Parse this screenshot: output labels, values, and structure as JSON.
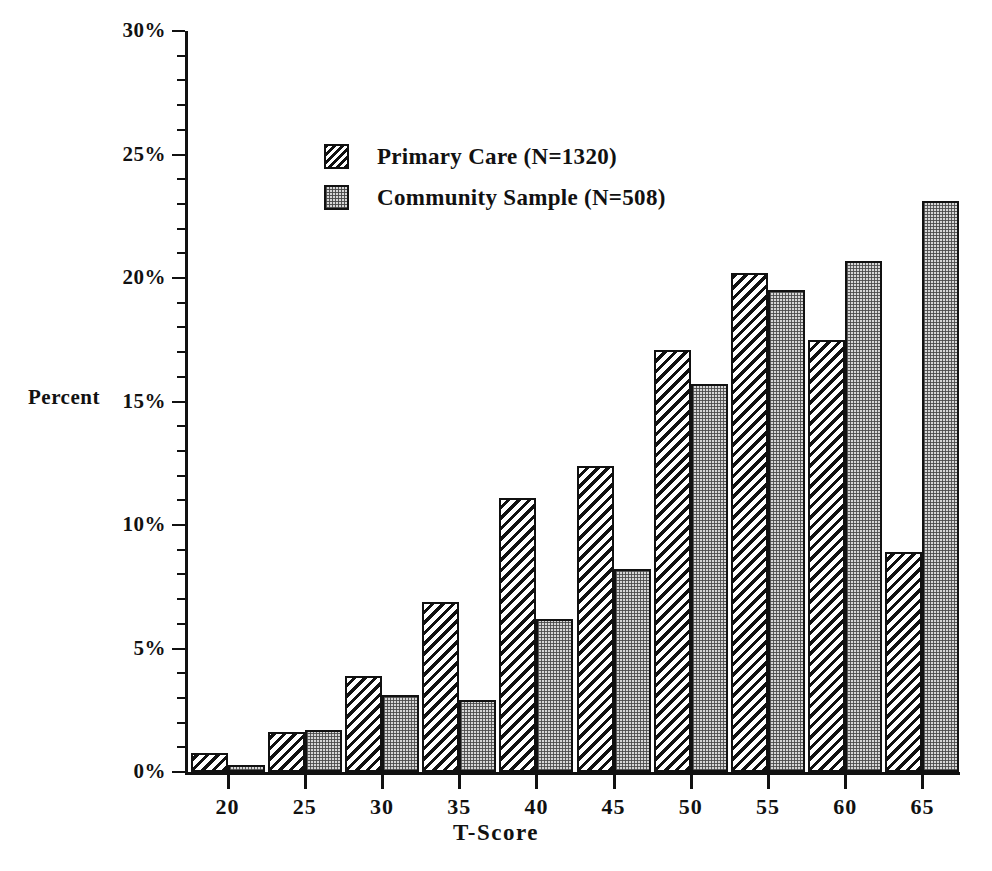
{
  "chart_data": {
    "type": "bar",
    "title": "",
    "xlabel": "T-Score",
    "ylabel": "Percent",
    "categories": [
      "20",
      "25",
      "30",
      "35",
      "40",
      "45",
      "50",
      "55",
      "60",
      "65"
    ],
    "series": [
      {
        "name": "Primary Care (N=1320)",
        "pattern": "diagonal-hatch",
        "values": [
          0.75,
          1.6,
          3.9,
          6.9,
          11.1,
          12.4,
          17.1,
          20.2,
          17.5,
          8.9
        ]
      },
      {
        "name": "Community Sample (N=508)",
        "pattern": "dotted-stipple",
        "values": [
          0.3,
          1.7,
          3.1,
          2.9,
          6.2,
          8.2,
          15.7,
          19.5,
          20.7,
          23.1
        ]
      }
    ],
    "ylim": [
      0,
      30
    ],
    "ytick_labels": [
      "0%",
      "5%",
      "10%",
      "15%",
      "20%",
      "25%",
      "30%"
    ],
    "ytick_values": [
      0,
      5,
      10,
      15,
      20,
      25,
      30
    ],
    "yminor_interval": 1,
    "xtick_labels": [
      "20",
      "25",
      "30",
      "35",
      "40",
      "45",
      "50",
      "55",
      "60",
      "65"
    ],
    "grid": false,
    "legend_position": "upper-left-inside"
  },
  "axes": {
    "y_title": "Percent",
    "x_title": "T-Score"
  },
  "legend": {
    "entries": [
      {
        "label": "Primary Care (N=1320)",
        "swatch": "hatch"
      },
      {
        "label": "Community Sample (N=508)",
        "swatch": "dots"
      }
    ]
  }
}
